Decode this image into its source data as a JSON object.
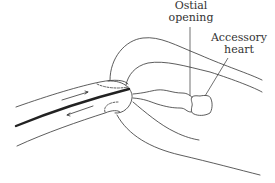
{
  "diagram": {
    "labels": {
      "ostial_line1": "Ostial",
      "ostial_line2": "opening",
      "heart_line1": "Accessory",
      "heart_line2": "heart"
    },
    "elements": [
      "capillary-tube",
      "flow-arrow-right",
      "flow-arrow-left",
      "body-outline",
      "ostial-opening",
      "accessory-heart"
    ],
    "colors": {
      "stroke": "#333333",
      "background": "#ffffff"
    }
  }
}
